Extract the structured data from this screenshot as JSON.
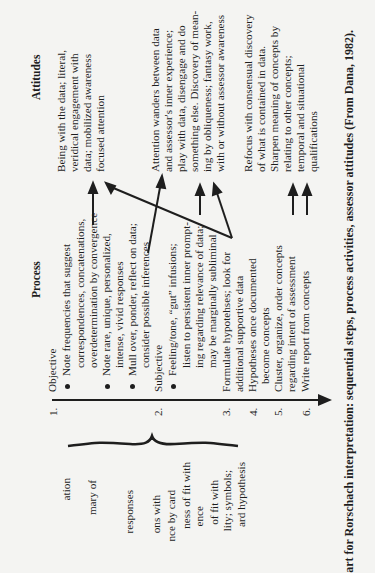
{
  "headers": {
    "process": "Process",
    "attitudes": "Attitudes"
  },
  "left_column_partial": [
    "ation",
    "mary of",
    "responses",
    "ons with",
    "nce by card",
    "ness of fit with",
    "ence",
    "of fit with",
    "lity; symbols;",
    "ard hypothesis"
  ],
  "process": {
    "steps": [
      {
        "number": "1.",
        "title": "Objective"
      },
      {
        "number": "2.",
        "title": "Subjective"
      },
      {
        "number": "3.",
        "title": "Formulate hypotehses; look for",
        "cont": "additional supportive data"
      },
      {
        "number": "4.",
        "title": "Hypotheses once documented",
        "cont": "become concepts"
      },
      {
        "number": "5.",
        "title": "Cluster, organize, order concepts",
        "cont": "regarding intent of assessment"
      },
      {
        "number": "6.",
        "title": "Write report from concepts"
      }
    ],
    "bullets": [
      {
        "first": "Note frequencies that suggest",
        "rest": [
          "correspondences, concatenations,",
          "overdetermination by convergence"
        ]
      },
      {
        "first": "Note rare, unique, personalized,",
        "rest": [
          "intense, vivid responses"
        ]
      },
      {
        "first": "Mull over, ponder, reflect on data;",
        "rest": [
          "consider possible inferences"
        ]
      },
      {
        "first": "Feeling/tone, “gut” infusions;",
        "rest": [
          "listen to persistent inner prompt-",
          "ing regarding relevance of data;",
          "may be marginally subliminal"
        ]
      }
    ]
  },
  "attitudes": {
    "groups": [
      [
        "Being with the data; literal,",
        "veridical engagement with",
        "data; mobilized awareness",
        "focused attention"
      ],
      [
        "Attention wanders between data",
        "and assessor's inner experience;",
        "play with data, disengage and do",
        "something else. Discovery of mean-",
        "ing by obliqueness; fantasy work,",
        "with or without assessor awareness"
      ],
      [
        "Refocus with consensual discovery",
        "of what is contained in data.",
        "Sharpen meaning of concepts by",
        "relating to other concepts;",
        "temporal and situational",
        "qualifications"
      ]
    ]
  },
  "caption": "art for Rorschach interpretation: sequential steps, process activities, assessor attitudes (From Dana, 1982).",
  "colors": {
    "paper": "#f4f4f2",
    "ink": "#1e1e1e"
  }
}
